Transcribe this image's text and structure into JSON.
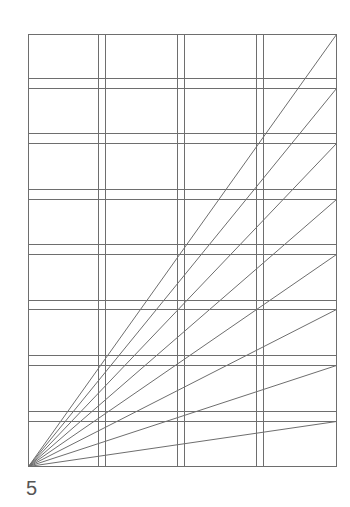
{
  "figure": {
    "label": "5"
  },
  "style": {
    "line_color": "#6e6e6e",
    "label_color": "#555555",
    "background": "#ffffff",
    "stroke_width": 1
  },
  "frame": {
    "left": 28,
    "top": 34,
    "right": 336,
    "bottom": 466
  },
  "vertical_line_pairs": [
    [
      98,
      105
    ],
    [
      177,
      184
    ],
    [
      256,
      263
    ]
  ],
  "horizontal_line_pairs": [
    [
      78,
      88
    ],
    [
      133,
      143
    ],
    [
      189,
      199
    ],
    [
      244,
      254
    ],
    [
      300,
      309
    ],
    [
      355,
      365
    ],
    [
      411,
      421
    ]
  ],
  "diagonals": {
    "origin": [
      28,
      466
    ],
    "end_x": 336,
    "end_y": [
      34,
      88,
      143,
      199,
      254,
      309,
      365,
      421
    ]
  }
}
